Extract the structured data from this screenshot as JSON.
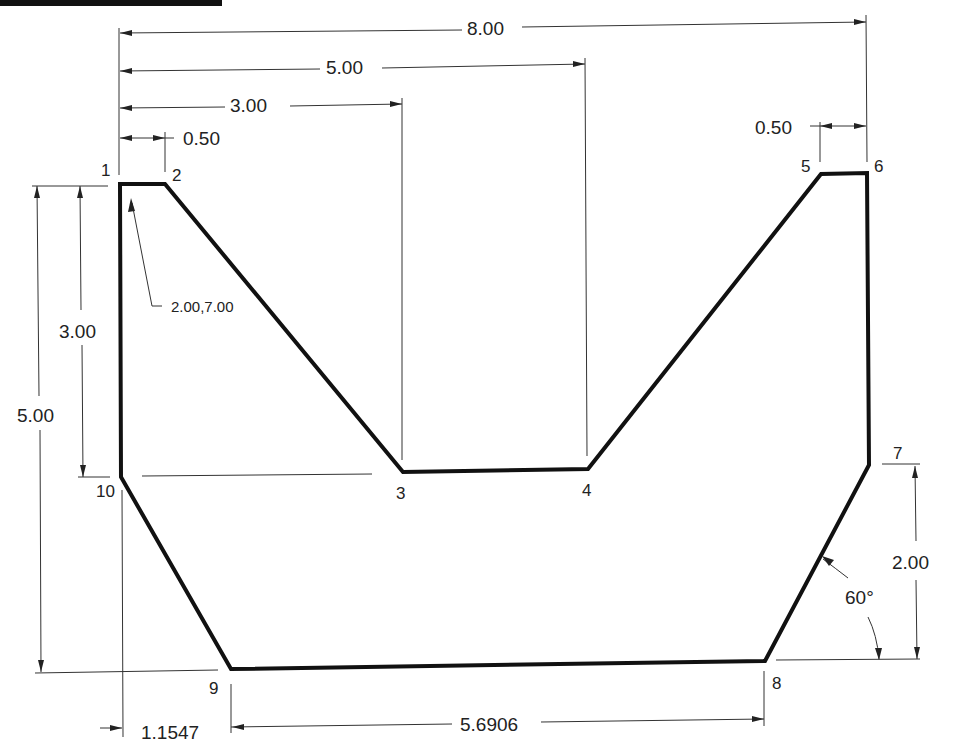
{
  "drawing": {
    "colors": {
      "outline": "#111111",
      "dimension_lines": "#333333",
      "text": "#222222",
      "background": "#ffffff",
      "header_bar": "#111111"
    },
    "points": [
      {
        "label": "1",
        "x": 120,
        "y": 184
      },
      {
        "label": "2",
        "x": 165,
        "y": 184
      },
      {
        "label": "3",
        "x": 403,
        "y": 472
      },
      {
        "label": "4",
        "x": 588,
        "y": 469
      },
      {
        "label": "5",
        "x": 821,
        "y": 174
      },
      {
        "label": "6",
        "x": 867,
        "y": 173
      },
      {
        "label": "7",
        "x": 869,
        "y": 465
      },
      {
        "label": "8",
        "x": 765,
        "y": 661
      },
      {
        "label": "9",
        "x": 231,
        "y": 669
      },
      {
        "label": "10",
        "x": 121,
        "y": 477
      }
    ],
    "point_labels": {
      "p1": "1",
      "p2": "2",
      "p3": "3",
      "p4": "4",
      "p5": "5",
      "p6": "6",
      "p7": "7",
      "p8": "8",
      "p9": "9",
      "p10": "10"
    },
    "dimensions": {
      "top_overall": "8.00",
      "top_to_point4": "5.00",
      "top_to_point3": "3.00",
      "top_left_chamfer": "0.50",
      "top_right_chamfer": "0.50",
      "left_inner_height": "3.00",
      "left_overall_height": "5.00",
      "right_lower_height": "2.00",
      "bottom_left_offset": "1.1547",
      "bottom_length": "5.6906",
      "angle": "60°"
    },
    "notes": {
      "start_coordinate": "2.00,7.00"
    }
  }
}
